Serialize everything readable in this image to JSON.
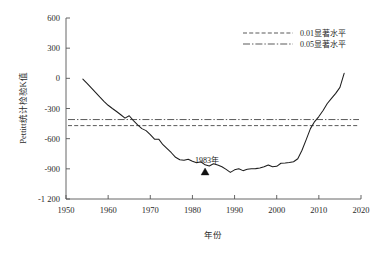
{
  "chart_data": {
    "type": "line",
    "title": "",
    "subtitle": "",
    "xlabel": "年份",
    "ylabel": "Pettitt统计检验K值",
    "xlim": [
      1950,
      2020
    ],
    "ylim": [
      -1200,
      600
    ],
    "xticks": [
      1950,
      1960,
      1970,
      1980,
      1990,
      2000,
      2010,
      2020
    ],
    "yticks": [
      600,
      300,
      0,
      -300,
      -600,
      -900,
      -1200
    ],
    "xticklabels": [
      "1950",
      "1960",
      "1970",
      "1980",
      "1990",
      "2000",
      "2010",
      "2020"
    ],
    "yticklabels": [
      "600",
      "300",
      "0",
      "-300",
      "-600",
      "-900",
      "-1 200"
    ],
    "grid": false,
    "legend_position": "upper-right",
    "legend": [
      {
        "label": "0.01显著水平",
        "style": "dashed",
        "value": -470
      },
      {
        "label": "0.05显著水平",
        "style": "dash-dot",
        "value": -410
      }
    ],
    "hlines": [
      {
        "name": "0.01显著水平",
        "y": -470,
        "style": "dashed"
      },
      {
        "name": "0.05显著水平",
        "y": -410,
        "style": "dash-dot"
      }
    ],
    "annotations": [
      {
        "text": "1983年",
        "x": 1983,
        "y": -840,
        "marker": "triangle-up",
        "marker_x": 1983,
        "marker_y": -935
      }
    ],
    "series": [
      {
        "name": "Pettitt统计检验K值",
        "style": "solid",
        "color": "#1d1d1d",
        "x": [
          1954,
          1955,
          1956,
          1957,
          1958,
          1959,
          1960,
          1961,
          1962,
          1963,
          1964,
          1965,
          1966,
          1967,
          1968,
          1969,
          1970,
          1971,
          1972,
          1973,
          1974,
          1975,
          1976,
          1977,
          1978,
          1979,
          1980,
          1981,
          1982,
          1983,
          1984,
          1985,
          1986,
          1987,
          1988,
          1989,
          1990,
          1991,
          1992,
          1993,
          1994,
          1995,
          1996,
          1997,
          1998,
          1999,
          2000,
          2001,
          2002,
          2003,
          2004,
          2005,
          2006,
          2007,
          2008,
          2009,
          2010,
          2011,
          2012,
          2013,
          2014,
          2015,
          2016
        ],
        "y": [
          -8,
          -50,
          -95,
          -140,
          -185,
          -228,
          -268,
          -300,
          -330,
          -362,
          -396,
          -372,
          -420,
          -462,
          -500,
          -520,
          -560,
          -605,
          -605,
          -660,
          -700,
          -740,
          -785,
          -810,
          -815,
          -805,
          -825,
          -840,
          -830,
          -860,
          -872,
          -850,
          -862,
          -880,
          -905,
          -935,
          -910,
          -900,
          -918,
          -905,
          -900,
          -898,
          -892,
          -880,
          -862,
          -880,
          -875,
          -845,
          -842,
          -838,
          -830,
          -800,
          -715,
          -610,
          -500,
          -430,
          -380,
          -320,
          -250,
          -200,
          -150,
          -90,
          50
        ]
      }
    ]
  },
  "axis": {
    "y_label_text": "Pettitt统计检验K值",
    "x_label_text": "年份"
  }
}
